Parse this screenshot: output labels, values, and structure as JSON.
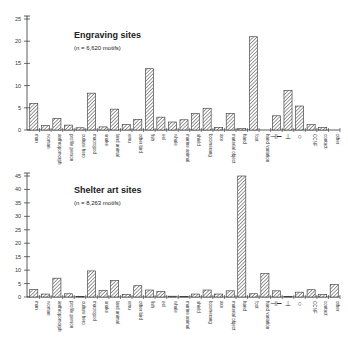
{
  "chart_data": [
    {
      "type": "bar",
      "title": "Engraving sites",
      "subtitle": "(n = 6,620 motifs)",
      "xlabel": "",
      "ylabel": "",
      "ylim": [
        0,
        25
      ],
      "yticks": [
        0,
        5,
        10,
        15,
        20,
        25
      ],
      "grid": false,
      "categories": [
        "man",
        "woman",
        "anthropomorph",
        "profile person",
        "culture hero",
        "macropod",
        "snake",
        "land animal",
        "emu",
        "other bird",
        "fish",
        "eel",
        "whale",
        "marine animal",
        "shield",
        "boomerang",
        "axe",
        "material object",
        "hand",
        "foot",
        "hand variation",
        "⊣⊢",
        "⊥",
        "○",
        "CCNF",
        "contact",
        "other"
      ],
      "values": [
        6.0,
        1.0,
        2.6,
        1.1,
        0.5,
        8.3,
        0.7,
        4.7,
        1.2,
        2.4,
        13.8,
        2.9,
        1.8,
        2.3,
        3.7,
        4.9,
        0.6,
        3.7,
        0.3,
        21.0,
        0.0,
        3.2,
        8.9,
        5.4,
        1.2,
        0.6,
        0.0
      ]
    },
    {
      "type": "bar",
      "title": "Shelter art sites",
      "subtitle": "(n = 8,263 motifs)",
      "xlabel": "",
      "ylabel": "",
      "ylim": [
        0,
        45
      ],
      "yticks": [
        0,
        5,
        10,
        15,
        20,
        25,
        30,
        35,
        40,
        45
      ],
      "grid": false,
      "categories": [
        "man",
        "woman",
        "anthropomorph",
        "profile person",
        "culture hero",
        "macropod",
        "snake",
        "land animal",
        "emu",
        "other bird",
        "fish",
        "eel",
        "whale",
        "marine animal",
        "shield",
        "boomerang",
        "axe",
        "material object",
        "hand",
        "foot",
        "hand variation",
        "⊣⊢",
        "⊥",
        "○",
        "CCNF",
        "contact",
        "other"
      ],
      "values": [
        2.8,
        1.1,
        7.0,
        1.2,
        0.2,
        9.7,
        2.4,
        6.1,
        1.0,
        4.2,
        2.6,
        2.1,
        0.3,
        0.2,
        1.1,
        2.6,
        1.1,
        2.3,
        45.0,
        1.2,
        8.7,
        2.3,
        0.2,
        1.8,
        2.7,
        0.9,
        4.6
      ]
    }
  ]
}
